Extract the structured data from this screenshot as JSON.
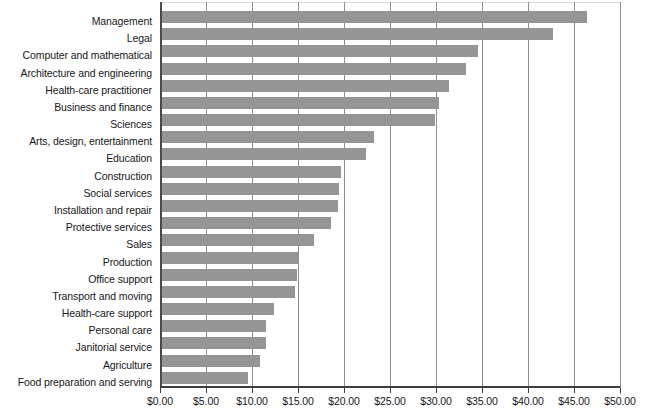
{
  "chart_data": {
    "type": "bar",
    "orientation": "horizontal",
    "title": "",
    "subtitle": "",
    "xlabel": "",
    "ylabel": "",
    "xlim": [
      0,
      50
    ],
    "xticks": [
      0,
      5,
      10,
      15,
      20,
      25,
      30,
      35,
      40,
      45,
      50
    ],
    "xticklabels": [
      "$0.00",
      "$5.00",
      "$10.00",
      "$15.00",
      "$20.00",
      "$25.00",
      "$30.00",
      "$35.00",
      "$40.00",
      "$45.00",
      "$50.00"
    ],
    "grid": true,
    "grid_axis": "x",
    "legend": null,
    "bar_color": "#959595",
    "categories": [
      "Management",
      "Legal",
      "Computer and mathematical",
      "Architecture and engineering",
      "Health-care practitioner",
      "Business and finance",
      "Sciences",
      "Arts, design, entertainment",
      "Education",
      "Construction",
      "Social services",
      "Installation and repair",
      "Protective services",
      "Sales",
      "Production",
      "Office support",
      "Transport and moving",
      "Health-care support",
      "Personal care",
      "Janitorial service",
      "Agriculture",
      "Food preparation and serving"
    ],
    "values": [
      46.3,
      42.6,
      34.5,
      33.1,
      31.3,
      30.2,
      29.8,
      23.2,
      22.3,
      19.6,
      19.3,
      19.2,
      18.5,
      16.6,
      14.9,
      14.8,
      14.6,
      12.3,
      11.4,
      11.4,
      10.8,
      9.5
    ]
  }
}
